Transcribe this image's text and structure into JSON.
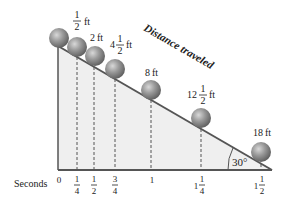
{
  "diagram": {
    "title_label": "Distance traveled",
    "axis_label": "Seconds",
    "angle_label": "30°",
    "colors": {
      "ramp_fill": "#efefef",
      "ramp_line": "#555555",
      "ball": "#8a8a8a",
      "text": "#222222"
    },
    "time_ticks": [
      {
        "whole": "0",
        "num": "",
        "den": ""
      },
      {
        "whole": "",
        "num": "1",
        "den": "4"
      },
      {
        "whole": "",
        "num": "1",
        "den": "2"
      },
      {
        "whole": "",
        "num": "3",
        "den": "4"
      },
      {
        "whole": "1",
        "num": "",
        "den": ""
      },
      {
        "whole": "1",
        "num": "1",
        "den": "4"
      },
      {
        "whole": "1",
        "num": "1",
        "den": "2"
      }
    ],
    "distances": [
      {
        "whole": "",
        "num": "1",
        "den": "2",
        "unit": "ft"
      },
      {
        "whole": "2",
        "num": "",
        "den": "",
        "unit": "ft"
      },
      {
        "whole": "4",
        "num": "1",
        "den": "2",
        "unit": "ft"
      },
      {
        "whole": "8",
        "num": "",
        "den": "",
        "unit": "ft"
      },
      {
        "whole": "12",
        "num": "1",
        "den": "2",
        "unit": "ft"
      },
      {
        "whole": "18",
        "num": "",
        "den": "",
        "unit": "ft"
      }
    ]
  }
}
